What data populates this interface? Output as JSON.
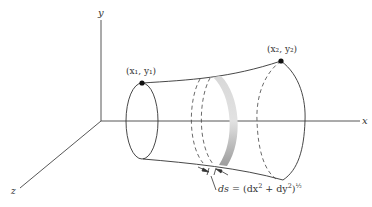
{
  "diagram": {
    "type": "surface-of-revolution",
    "axes": {
      "x_label": "x",
      "y_label": "y",
      "z_label": "z"
    },
    "points": {
      "start": {
        "label": "(x₁, y₁)"
      },
      "end": {
        "label": "(x₂, y₂)"
      }
    },
    "arc_element": {
      "label_lhs": "ds",
      "label_eq": " = (dx",
      "label_sup1": "2",
      "label_mid": " + dy",
      "label_sup2": "2",
      "label_close": ")",
      "label_exp": "½"
    },
    "colors": {
      "line": "#333333",
      "band_light": "#e6e6e6",
      "band_dark": "#9a9a9a"
    }
  }
}
